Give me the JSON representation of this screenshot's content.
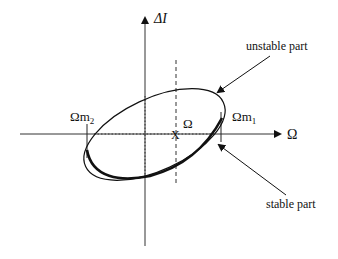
{
  "diagram": {
    "axes": {
      "y_label": "ΔI",
      "x_label": "Ω"
    },
    "labels": {
      "omega_m2": "Ωm",
      "omega_m2_sub": "2",
      "omega_m1": "Ωm",
      "omega_m1_sub": "1",
      "center_marker": "X",
      "center_label": "Ω",
      "unstable": "unstable part",
      "stable": "stable part"
    },
    "colors": {
      "stroke": "#111111",
      "background": "#ffffff"
    }
  }
}
